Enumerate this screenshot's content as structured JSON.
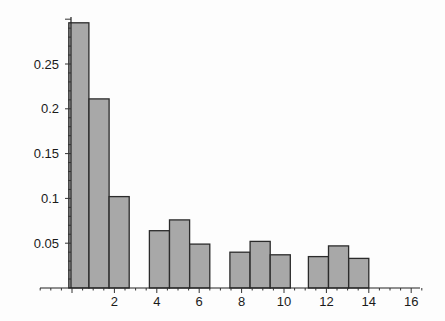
{
  "chart_data": {
    "type": "bar",
    "title": "",
    "xlabel": "",
    "ylabel": "",
    "xlim": [
      -1.5,
      16.5
    ],
    "ylim": [
      0,
      0.3
    ],
    "grid": false,
    "legend": null,
    "bar_width": 0.95,
    "bars": [
      {
        "x_start": -0.15,
        "x_end": 0.8,
        "value": 0.296
      },
      {
        "x_start": 0.8,
        "x_end": 1.75,
        "value": 0.211
      },
      {
        "x_start": 1.75,
        "x_end": 2.7,
        "value": 0.102
      },
      {
        "x_start": 3.65,
        "x_end": 4.6,
        "value": 0.064
      },
      {
        "x_start": 4.6,
        "x_end": 5.55,
        "value": 0.076
      },
      {
        "x_start": 5.55,
        "x_end": 6.5,
        "value": 0.049
      },
      {
        "x_start": 7.45,
        "x_end": 8.4,
        "value": 0.04
      },
      {
        "x_start": 8.4,
        "x_end": 9.35,
        "value": 0.052
      },
      {
        "x_start": 9.35,
        "x_end": 10.3,
        "value": 0.037
      },
      {
        "x_start": 11.15,
        "x_end": 12.1,
        "value": 0.035
      },
      {
        "x_start": 12.1,
        "x_end": 13.05,
        "value": 0.047
      },
      {
        "x_start": 13.05,
        "x_end": 14.0,
        "value": 0.033
      }
    ],
    "x_ticks": [
      2,
      4,
      6,
      8,
      10,
      12,
      14,
      16
    ],
    "x_tick_labels": [
      "2",
      "4",
      "6",
      "8",
      "10",
      "12",
      "14",
      "16"
    ],
    "x_minor_step": 0.5,
    "y_ticks": [
      0.05,
      0.1,
      0.15,
      0.2,
      0.25
    ],
    "y_tick_labels": [
      "0.05",
      "0.1",
      "0.15",
      "0.2",
      "0.25"
    ],
    "y_minor_step": 0.01,
    "colors": {
      "bar_fill": "#a8a8a8",
      "bar_stroke": "#2b2b2b",
      "axis": "#222222",
      "background": "#fdfdfd"
    }
  }
}
